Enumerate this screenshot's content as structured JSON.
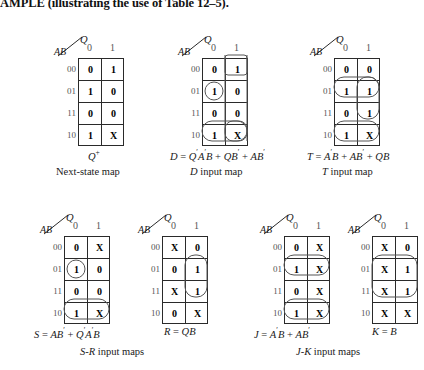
{
  "heading": "AMPLE (illustrating the use of Table 12–5).",
  "axis": {
    "q_label": "Q",
    "ab_label": "AB",
    "col_headers": [
      "0",
      "1"
    ],
    "row_headers": [
      "00",
      "01",
      "11",
      "10"
    ]
  },
  "maps": [
    {
      "id": "next-state-map",
      "cells": [
        [
          "0",
          "1"
        ],
        [
          "1",
          "0"
        ],
        [
          "0",
          "0"
        ],
        [
          "1",
          "X"
        ]
      ],
      "equation": "Q+",
      "caption": "Next-state map"
    },
    {
      "id": "d-input-map",
      "cells": [
        [
          "0",
          "1"
        ],
        [
          "1",
          "0"
        ],
        [
          "0",
          "0"
        ],
        [
          "1",
          "X"
        ]
      ],
      "equation": "D = Q'A'B + QB' + AB'",
      "caption": "D input map"
    },
    {
      "id": "t-input-map",
      "cells": [
        [
          "0",
          "0"
        ],
        [
          "1",
          "1"
        ],
        [
          "0",
          "1"
        ],
        [
          "1",
          "X"
        ]
      ],
      "equation": "T = A'B + AB' + QB",
      "caption": "T input map"
    },
    {
      "id": "s-input-map",
      "cells": [
        [
          "0",
          "X"
        ],
        [
          "1",
          "0"
        ],
        [
          "0",
          "0"
        ],
        [
          "1",
          "X"
        ]
      ],
      "equation": "S = AB' + Q'A'B",
      "caption": ""
    },
    {
      "id": "r-input-map",
      "cells": [
        [
          "X",
          "0"
        ],
        [
          "0",
          "1"
        ],
        [
          "X",
          "1"
        ],
        [
          "0",
          "X"
        ]
      ],
      "equation": "R = QB",
      "caption": ""
    },
    {
      "id": "j-input-map",
      "cells": [
        [
          "0",
          "X"
        ],
        [
          "1",
          "X"
        ],
        [
          "0",
          "X"
        ],
        [
          "1",
          "X"
        ]
      ],
      "equation": "J = A'B + AB'",
      "caption": ""
    },
    {
      "id": "k-input-map",
      "cells": [
        [
          "X",
          "0"
        ],
        [
          "X",
          "1"
        ],
        [
          "X",
          "1"
        ],
        [
          "X",
          "X"
        ]
      ],
      "equation": "K = B",
      "caption": ""
    }
  ],
  "group_captions": {
    "sr": "S-R input maps",
    "jk": "J-K input maps"
  },
  "colors": {
    "ink": "#1a1a1a",
    "grid": "#2a2a2a",
    "group": "#555555",
    "header": "#555555"
  }
}
